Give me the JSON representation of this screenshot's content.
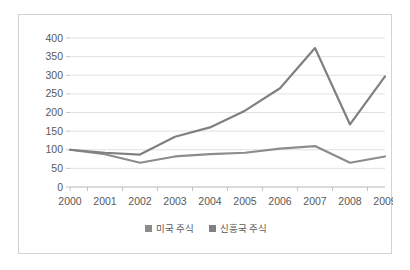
{
  "chart_data": {
    "type": "line",
    "title": "",
    "subtitle": "",
    "xlabel": "",
    "ylabel": "",
    "categories": [
      "2000",
      "2001",
      "2002",
      "2003",
      "2004",
      "2005",
      "2006",
      "2007",
      "2008",
      "2009"
    ],
    "series": [
      {
        "name": "미국 주식",
        "color": "#8c8c8c",
        "values": [
          100,
          88,
          65,
          82,
          88,
          92,
          103,
          110,
          65,
          82
        ]
      },
      {
        "name": "신흥국 주식",
        "color": "#808080",
        "values": [
          100,
          92,
          87,
          135,
          160,
          205,
          265,
          373,
          168,
          297
        ]
      }
    ],
    "ylim": [
      0,
      400
    ],
    "ytick_step": 50,
    "yticks": [
      "400",
      "350",
      "300",
      "250",
      "200",
      "150",
      "100",
      "50",
      "0"
    ],
    "grid": true,
    "legend_position": "bottom",
    "annotations": []
  },
  "legend": {
    "entries": [
      {
        "label": "미국 주식",
        "color": "#8c8c8c"
      },
      {
        "label": "신흥국 주식",
        "color": "#808080"
      }
    ]
  },
  "frame": {
    "border_color": "#d2d2d2",
    "background": "#ffffff"
  }
}
